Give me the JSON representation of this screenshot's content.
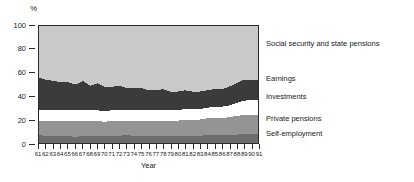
{
  "chart_data": {
    "type": "area",
    "stacked": true,
    "title": "",
    "subtitle": "",
    "xlabel": "Year",
    "ylabel": "%",
    "ylim": [
      0,
      100
    ],
    "yticks": [
      0,
      20,
      40,
      60,
      80,
      100
    ],
    "ytick_labels": [
      "0",
      "20",
      "40",
      "60",
      "80",
      "100"
    ],
    "grid": false,
    "legend_position": "right-inline",
    "x": [
      61,
      62,
      63,
      64,
      65,
      66,
      67,
      68,
      69,
      70,
      71,
      72,
      73,
      74,
      75,
      76,
      77,
      78,
      79,
      80,
      81,
      82,
      83,
      84,
      85,
      86,
      87,
      88,
      89,
      90,
      91
    ],
    "xtick_labels": [
      "61",
      "62",
      "63",
      "64",
      "65",
      "66",
      "67",
      "68",
      "69",
      "70",
      "71",
      "72",
      "73",
      "74",
      "75",
      "76",
      "77",
      "78",
      "79",
      "80",
      "81",
      "82",
      "83",
      "84",
      "85",
      "86",
      "87",
      "88",
      "89",
      "90",
      "91"
    ],
    "series": [
      {
        "name": "Self-employment",
        "color": "#6d6d6d",
        "label_y_px": 133,
        "values": [
          7,
          6,
          6,
          6,
          6,
          5,
          6,
          6,
          6,
          6,
          6,
          6,
          7,
          6,
          6,
          6,
          6,
          6,
          6,
          6,
          6,
          6,
          6,
          7,
          7,
          7,
          7,
          7,
          8,
          8,
          8
        ]
      },
      {
        "name": "Private pensions",
        "color": "#949494",
        "label_y_px": 118,
        "values": [
          12,
          13,
          13,
          13,
          13,
          14,
          13,
          13,
          13,
          12,
          13,
          13,
          12,
          13,
          13,
          13,
          13,
          13,
          13,
          13,
          14,
          14,
          14,
          14,
          14,
          14,
          15,
          16,
          16,
          16,
          16
        ]
      },
      {
        "name": "Investments",
        "color": "#ffffff",
        "label_y_px": 96,
        "values": [
          9,
          9,
          9,
          9,
          9,
          9,
          9,
          9,
          9,
          9,
          9,
          9,
          9,
          9,
          9,
          9,
          9,
          9,
          9,
          9,
          9,
          9,
          9,
          9,
          10,
          10,
          10,
          11,
          12,
          13,
          13
        ]
      },
      {
        "name": "Earnings",
        "color": "#3b3b3b",
        "label_y_px": 78,
        "values": [
          28,
          26,
          25,
          24,
          24,
          22,
          25,
          21,
          23,
          21,
          20,
          21,
          19,
          19,
          19,
          17,
          17,
          18,
          16,
          16,
          16,
          15,
          15,
          15,
          15,
          15,
          16,
          17,
          18,
          17,
          17
        ]
      },
      {
        "name": "Social security and state pensions",
        "color": "#c9c9c9",
        "label_y_px": 43,
        "values": [
          44,
          46,
          47,
          48,
          48,
          50,
          47,
          51,
          49,
          52,
          52,
          51,
          53,
          53,
          53,
          55,
          55,
          54,
          56,
          56,
          55,
          56,
          56,
          55,
          54,
          54,
          52,
          49,
          46,
          46,
          46
        ]
      }
    ]
  }
}
